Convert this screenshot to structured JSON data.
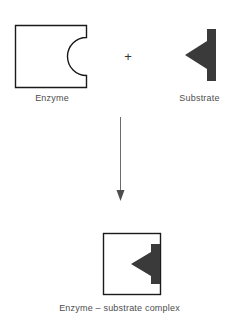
{
  "figure": {
    "title_text": "",
    "background_color": "#ffffff",
    "outline_color": "#1a1a1a",
    "fill_shape_color": "#3a3a3a",
    "label_color": "#4d4d4d"
  },
  "operator": {
    "plus_symbol": "+"
  },
  "labels": {
    "enzyme": "Enzyme",
    "substrate": "Substrate",
    "complex": "Enzyme – substrate complex"
  },
  "shapes": {
    "enzyme": {
      "name": "enzyme-square-with-notch",
      "x": 15,
      "y": 25,
      "width": 72,
      "height": 63,
      "notch": "concave-semicircle-right-edge",
      "notch_radius": 19,
      "stroke_width": 1.4,
      "fill": "#ffffff",
      "stroke": "#1a1a1a"
    },
    "substrate": {
      "name": "substrate-arrow-wedge",
      "x": 185,
      "y": 29,
      "width": 31,
      "height": 52,
      "fill": "#3a3a3a",
      "orientation": "pointing-left"
    },
    "complex": {
      "name": "enzyme-substrate-complex",
      "x": 103,
      "y": 233,
      "width": 58,
      "height": 62,
      "stroke": "#1a1a1a",
      "fill": "#ffffff",
      "bound_substrate_fill": "#3a3a3a"
    },
    "arrow": {
      "name": "reaction-arrow-down",
      "x": 120,
      "y_start": 117,
      "y_end": 200,
      "stroke": "#6b6b6b",
      "stroke_width": 1
    }
  }
}
